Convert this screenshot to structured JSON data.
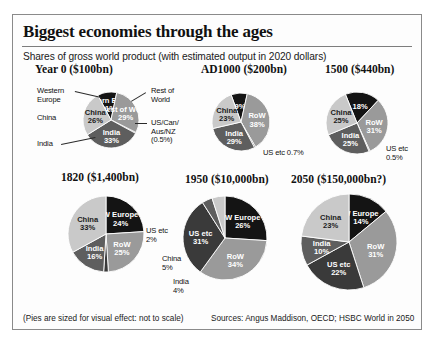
{
  "header": {
    "title": "Biggest economies through the ages",
    "subtitle": "Shares of gross world product (with estimated output in 2020 dollars)"
  },
  "footer": {
    "note": "(Pies are sized for visual effect: not to scale)",
    "sources": "Sources: Angus Maddison, OECD; HSBC World in 2050"
  },
  "colors": {
    "western_europe": "#141414",
    "rest_of_world": "#9a9a9a",
    "us_etc": "#3a3a3a",
    "india": "#5e5e5e",
    "china": "#c9c9c9",
    "border": "#8a8a8a",
    "text": "#1a1a1a"
  },
  "chart_data": [
    {
      "type": "pie",
      "title": "Year 0 ($100bn)",
      "total_label": "$100bn",
      "year": "Year 0",
      "slices": [
        {
          "name": "Western Europe",
          "short": "Western Europe",
          "value": 11,
          "label": "11%",
          "color": "#141414",
          "label_placement": "inner"
        },
        {
          "name": "Rest of World",
          "short": "Rest of World",
          "value": 29,
          "label": "29%",
          "color": "#9a9a9a",
          "label_placement": "inner"
        },
        {
          "name": "US/Can/Aus/NZ",
          "short": "US/Can/Aus/NZ (0.5%)",
          "value": 0.5,
          "label": "0.5%",
          "color": "#3a3a3a",
          "label_placement": "outer"
        },
        {
          "name": "India",
          "short": "India",
          "value": 33,
          "label": "33%",
          "color": "#5e5e5e",
          "label_placement": "inner"
        },
        {
          "name": "China",
          "short": "China",
          "value": 26,
          "label": "26%",
          "color": "#c9c9c9",
          "label_placement": "inner"
        }
      ],
      "callouts": [
        {
          "text": "Western\nEurope",
          "side": "left"
        },
        {
          "text": "China",
          "side": "left"
        },
        {
          "text": "India",
          "side": "left"
        },
        {
          "text": "Rest of\nWorld",
          "side": "right"
        },
        {
          "text": "US/Can/\nAus/NZ\n(0.5%)",
          "side": "right"
        }
      ]
    },
    {
      "type": "pie",
      "title": "AD1000 ($200bn)",
      "total_label": "$200bn",
      "year": "AD1000",
      "slices": [
        {
          "name": "Western Europe",
          "short": "",
          "value": 9,
          "label": "9%",
          "color": "#141414",
          "label_placement": "inner"
        },
        {
          "name": "Rest of World",
          "short": "RoW",
          "value": 38,
          "label": "38%",
          "color": "#9a9a9a",
          "label_placement": "inner"
        },
        {
          "name": "US etc",
          "short": "US etc",
          "value": 0.7,
          "label": "0.7%",
          "color": "#3a3a3a",
          "label_placement": "outer"
        },
        {
          "name": "India",
          "short": "India",
          "value": 29,
          "label": "29%",
          "color": "#5e5e5e",
          "label_placement": "inner"
        },
        {
          "name": "China",
          "short": "China",
          "value": 23,
          "label": "23%",
          "color": "#c9c9c9",
          "label_placement": "inner"
        }
      ],
      "callouts": [
        {
          "text": "US etc 0.7%",
          "side": "right"
        }
      ]
    },
    {
      "type": "pie",
      "title": "1500 ($440bn)",
      "total_label": "$440bn",
      "year": "1500",
      "slices": [
        {
          "name": "Western Europe",
          "short": "",
          "value": 18,
          "label": "18%",
          "color": "#141414",
          "label_placement": "inner"
        },
        {
          "name": "Rest of World",
          "short": "RoW",
          "value": 31,
          "label": "31%",
          "color": "#9a9a9a",
          "label_placement": "inner"
        },
        {
          "name": "US etc",
          "short": "US etc",
          "value": 0.5,
          "label": "0.5%",
          "color": "#3a3a3a",
          "label_placement": "outer"
        },
        {
          "name": "India",
          "short": "India",
          "value": 25,
          "label": "25%",
          "color": "#5e5e5e",
          "label_placement": "inner"
        },
        {
          "name": "China",
          "short": "China",
          "value": 25,
          "label": "25%",
          "color": "#c9c9c9",
          "label_placement": "inner"
        }
      ],
      "callouts": [
        {
          "text": "US etc\n0.5%",
          "side": "right"
        }
      ]
    },
    {
      "type": "pie",
      "title": "1820 ($1,400bn)",
      "total_label": "$1,400bn",
      "year": "1820",
      "slices": [
        {
          "name": "Western Europe",
          "short": "W Europe",
          "value": 24,
          "label": "24%",
          "color": "#141414",
          "label_placement": "inner"
        },
        {
          "name": "Rest of World",
          "short": "RoW",
          "value": 25,
          "label": "25%",
          "color": "#9a9a9a",
          "label_placement": "inner"
        },
        {
          "name": "US etc",
          "short": "US etc",
          "value": 2,
          "label": "2%",
          "color": "#3a3a3a",
          "label_placement": "outer"
        },
        {
          "name": "India",
          "short": "India",
          "value": 16,
          "label": "16%",
          "color": "#5e5e5e",
          "label_placement": "inner"
        },
        {
          "name": "China",
          "short": "China",
          "value": 33,
          "label": "33%",
          "color": "#c9c9c9",
          "label_placement": "inner"
        }
      ],
      "callouts": [
        {
          "text": "US etc\n2%",
          "side": "right"
        }
      ]
    },
    {
      "type": "pie",
      "title": "1950 ($10,000bn)",
      "total_label": "$10,000bn",
      "year": "1950",
      "slices": [
        {
          "name": "Western Europe",
          "short": "W Europe",
          "value": 26,
          "label": "26%",
          "color": "#141414",
          "label_placement": "inner"
        },
        {
          "name": "Rest of World",
          "short": "RoW",
          "value": 34,
          "label": "34%",
          "color": "#9a9a9a",
          "label_placement": "inner"
        },
        {
          "name": "US etc",
          "short": "US etc",
          "value": 31,
          "label": "31%",
          "color": "#3a3a3a",
          "label_placement": "inner"
        },
        {
          "name": "India",
          "short": "India",
          "value": 4,
          "label": "4%",
          "color": "#5e5e5e",
          "label_placement": "outer"
        },
        {
          "name": "China",
          "short": "China",
          "value": 5,
          "label": "5%",
          "color": "#c9c9c9",
          "label_placement": "outer"
        }
      ],
      "callouts": [
        {
          "text": "China\n5%",
          "side": "left"
        },
        {
          "text": "India\n4%",
          "side": "left"
        }
      ]
    },
    {
      "type": "pie",
      "title": "2050 ($150,000bn?)",
      "total_label": "$150,000bn?",
      "year": "2050",
      "slices": [
        {
          "name": "Western Europe",
          "short": "W Europe",
          "value": 14,
          "label": "14%",
          "color": "#141414",
          "label_placement": "inner"
        },
        {
          "name": "Rest of World",
          "short": "RoW",
          "value": 31,
          "label": "31%",
          "color": "#9a9a9a",
          "label_placement": "inner"
        },
        {
          "name": "US etc",
          "short": "US etc",
          "value": 22,
          "label": "22%",
          "color": "#3a3a3a",
          "label_placement": "inner"
        },
        {
          "name": "India",
          "short": "India",
          "value": 10,
          "label": "10%",
          "color": "#5e5e5e",
          "label_placement": "inner"
        },
        {
          "name": "China",
          "short": "China",
          "value": 23,
          "label": "23%",
          "color": "#c9c9c9",
          "label_placement": "inner"
        }
      ],
      "callouts": []
    }
  ]
}
